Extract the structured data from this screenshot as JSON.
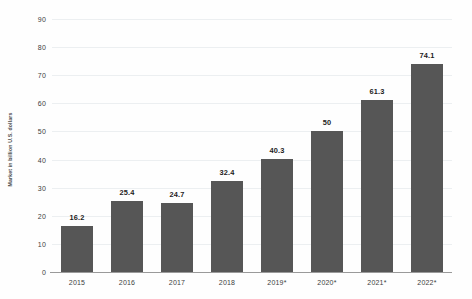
{
  "chart_data": {
    "type": "bar",
    "title": "",
    "subtitle": "",
    "xlabel": "",
    "ylabel": "Market in billion U.S. dollars",
    "categories": [
      "2015",
      "2016",
      "2017",
      "2018",
      "2019*",
      "2020*",
      "2021*",
      "2022*"
    ],
    "values": [
      16.2,
      25.4,
      24.7,
      32.4,
      40.3,
      50,
      61.3,
      74.1
    ],
    "value_labels": [
      "16.2",
      "25.4",
      "24.7",
      "32.4",
      "40.3",
      "50",
      "61.3",
      "74.1"
    ],
    "ylim": [
      0,
      90
    ],
    "yticks": [
      0,
      10,
      20,
      30,
      40,
      50,
      60,
      70,
      80,
      90
    ],
    "ytick_labels": [
      "0",
      "10",
      "20",
      "30",
      "40",
      "50",
      "60",
      "70",
      "80",
      "90"
    ],
    "grid": true,
    "legend": "none",
    "bar_color": "#565656",
    "gridline_color": "#eceff1",
    "axis_color": "#9a9a9a",
    "background_color": "#fefefe"
  }
}
